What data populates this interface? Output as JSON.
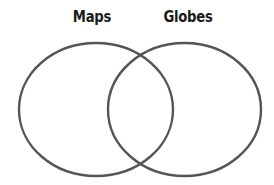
{
  "diagram": {
    "type": "venn",
    "sets": [
      {
        "label": "Maps",
        "cx": 96,
        "cy": 109.5,
        "rx": 77,
        "ry": 66.5
      },
      {
        "label": "Globes",
        "cx": 184.5,
        "cy": 109.5,
        "rx": 76.5,
        "ry": 66.5
      }
    ],
    "stroke_color": "#555555",
    "stroke_width": 2.4,
    "background": "#ffffff"
  }
}
